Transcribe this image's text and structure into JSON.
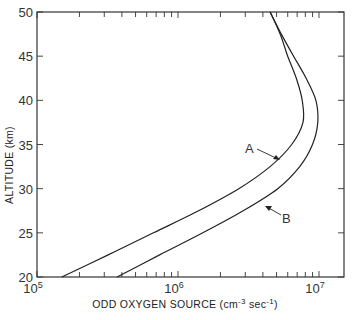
{
  "chart_data": {
    "type": "line",
    "title": "",
    "xlabel": "ODD  OXYGEN  SOURCE (cm⁻³ sec⁻¹)",
    "ylabel": "ALTITUDE  (km)",
    "xscale": "log",
    "xlim": [
      100000,
      20000000
    ],
    "ylim": [
      20,
      50
    ],
    "grid": false,
    "x_tick_labels": [
      "10^5",
      "10^6",
      "10^7"
    ],
    "y_tick_labels": [
      "20",
      "25",
      "30",
      "35",
      "40",
      "45",
      "50"
    ],
    "series": [
      {
        "name": "A",
        "altitude_km": [
          20,
          22.5,
          25,
          27.5,
          30,
          32.5,
          35,
          37.5,
          40,
          42.5,
          45,
          47.5,
          50
        ],
        "values": [
          150000,
          320000,
          670000,
          1400000,
          2700000,
          4500000,
          6400000,
          7700000,
          7600000,
          6900000,
          6000000,
          5300000,
          4500000
        ]
      },
      {
        "name": "B",
        "altitude_km": [
          20,
          22.5,
          25,
          27.5,
          30,
          32.5,
          35,
          37.5,
          40,
          42.5,
          45,
          47.5,
          50
        ],
        "values": [
          370000,
          740000,
          1500000,
          2900000,
          5100000,
          7300000,
          9000000,
          9800000,
          9500000,
          8100000,
          6600000,
          5400000,
          4500000
        ]
      }
    ],
    "annotations": [
      {
        "text": "A",
        "points_to_series": "A"
      },
      {
        "text": "B",
        "points_to_series": "B"
      }
    ]
  },
  "labels": {
    "y_title": "ALTITUDE  (km)",
    "x_title_main": "ODD  OXYGEN  SOURCE (cm",
    "x_title_exp1": "-3",
    "x_title_mid": " sec",
    "x_title_exp2": "-1",
    "x_title_end": ")",
    "x_ticks": [
      {
        "base": "10",
        "exp": "5"
      },
      {
        "base": "10",
        "exp": "6"
      },
      {
        "base": "10",
        "exp": "7"
      }
    ],
    "y_ticks": [
      "20",
      "25",
      "30",
      "35",
      "40",
      "45",
      "50"
    ],
    "curve_a": "A",
    "curve_b": "B"
  }
}
